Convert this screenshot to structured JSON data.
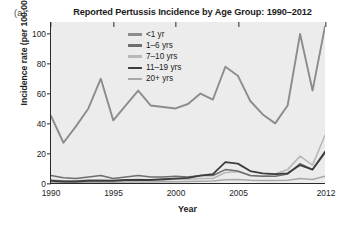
{
  "panel_label": "(a)",
  "xlabel": "Year",
  "ylabel": "Incidence rate (per 100,000)",
  "chart_data": {
    "type": "line",
    "title": "Reported Pertussis Incidence by Age Group: 1990–2012",
    "xlabel": "Year",
    "ylabel": "Incidence rate (per 100,000)",
    "xlim": [
      1990,
      2012
    ],
    "ylim": [
      0,
      108
    ],
    "yticks": [
      0,
      20,
      40,
      60,
      80,
      100
    ],
    "ytick_labels": [
      "0",
      "20",
      "40",
      "60",
      "80",
      "100"
    ],
    "xticks": [
      1990,
      1995,
      2000,
      2005,
      2012
    ],
    "xtick_labels": [
      "1990",
      "1995",
      "2000",
      "2005",
      "2012"
    ],
    "grid": false,
    "legend_position": "top-center",
    "x": [
      1990,
      1991,
      1992,
      1993,
      1994,
      1995,
      1996,
      1997,
      1998,
      1999,
      2000,
      2001,
      2002,
      2003,
      2004,
      2005,
      2006,
      2007,
      2008,
      2009,
      2010,
      2011,
      2012
    ],
    "series": [
      {
        "name": "<1 yr",
        "color": "#8c8c8c",
        "width": 1.9,
        "values": [
          45,
          27,
          38,
          50,
          70,
          42,
          52,
          62,
          52,
          51,
          50,
          53,
          60,
          56,
          78,
          72,
          55,
          46,
          40,
          52,
          100,
          62,
          105
        ]
      },
      {
        "name": "1–6 yrs",
        "color": "#6e6e6e",
        "width": 1.5,
        "values": [
          5,
          3.5,
          3,
          4,
          5,
          3,
          4,
          5,
          4,
          4,
          4.5,
          4,
          5,
          5,
          9,
          8,
          5,
          4.5,
          4.5,
          6,
          13,
          9,
          20
        ]
      },
      {
        "name": "7–10 yrs",
        "color": "#b8b8b8",
        "width": 1.6,
        "values": [
          2,
          1.5,
          1.5,
          2,
          2,
          1.5,
          2,
          2.5,
          2,
          2,
          2.5,
          2.5,
          3,
          3,
          7,
          7.5,
          5,
          4.5,
          6,
          9,
          18,
          12,
          32
        ]
      },
      {
        "name": "11–19 yrs",
        "color": "#3d3d3d",
        "width": 1.8,
        "values": [
          1.5,
          1,
          1,
          1.5,
          1.5,
          1.5,
          2,
          2,
          2,
          2.5,
          3,
          3.5,
          5,
          6,
          14,
          13,
          8,
          6.5,
          6,
          6.5,
          12,
          9,
          21
        ]
      },
      {
        "name": "20+ yrs",
        "color": "#a8a8a8",
        "width": 1.5,
        "values": [
          0.4,
          0.4,
          0.4,
          0.5,
          0.5,
          0.5,
          0.6,
          0.7,
          0.7,
          0.8,
          0.9,
          1,
          1.2,
          1.3,
          2.2,
          2.3,
          1.8,
          1.6,
          1.6,
          1.8,
          3,
          2.4,
          4.5
        ]
      }
    ]
  }
}
